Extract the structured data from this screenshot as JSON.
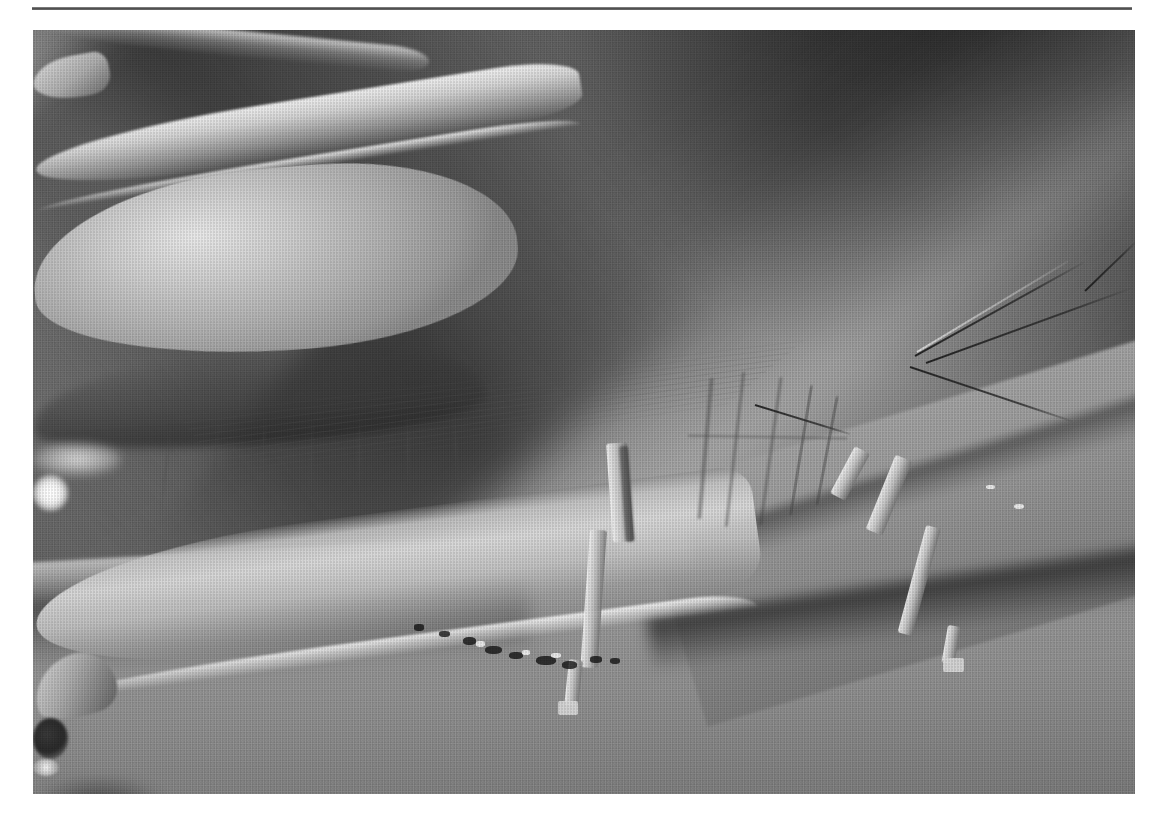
{
  "page": {
    "background_color": "#ffffff",
    "width": 1164,
    "height": 825
  },
  "rule": {
    "name": "horizontal-rule",
    "color": "#4a4a4a",
    "left": 32,
    "top": 7,
    "width": 1100,
    "height": 3
  },
  "figure": {
    "caption": "",
    "alt": "Black-and-white macro photograph of a grasshopper in profile, facing right, perched on broad grass blades",
    "frame": {
      "left": 33,
      "top": 30,
      "width": 1102,
      "height": 764
    },
    "rendering": "monochrome halftone print scan",
    "palette": {
      "paper": "#ffffff",
      "background_mid_gray": "#6a6a6a",
      "background_dark": "#2a2a2a",
      "highlight_white": "#f2f2f2",
      "body_light_gray": "#cdcdcd",
      "shadow_black": "#141414",
      "eye_dark": "#262626",
      "leaf_gray": "#939393"
    },
    "subject": {
      "name": "grasshopper",
      "orientation": "left profile, head at right, abdomen at left",
      "parts": [
        {
          "name": "head",
          "note": "pale, tilted forward-right"
        },
        {
          "name": "compound-eye",
          "note": "dark oval with two specular highlights"
        },
        {
          "name": "antennae",
          "count": 2,
          "note": "two fine dark filaments sweeping up and to the right"
        },
        {
          "name": "pronotum",
          "note": "saddle-shaped thoracic plate with vertical ridges"
        },
        {
          "name": "folded-wing",
          "note": "long tapering tegmen with fine longitudinal veins, covering abdomen"
        },
        {
          "name": "abdomen",
          "note": "pale bulging mass at left with segment rings and a bright specular spot"
        },
        {
          "name": "hind-leg-femur",
          "note": "large pale femur sweeping down to the lower left"
        },
        {
          "name": "hind-leg-tibia",
          "note": "slender spined tibia continuing to the lower left"
        },
        {
          "name": "middle-leg",
          "note": "descends from thorax to the leaf below, centre of frame"
        },
        {
          "name": "front-leg",
          "note": "descends to the right onto the foreground leaf"
        }
      ]
    },
    "scene": {
      "background": "soft out-of-focus grey with a dark mass in the upper-right corner",
      "bright_blade": "broad bright grass blade running diagonally from upper right toward centre-left",
      "shadow_band": "dark diagonal shadow band across the right side",
      "foreground": "two overlapping broad leaves across the lower third, lit from above with dark creases"
    }
  }
}
